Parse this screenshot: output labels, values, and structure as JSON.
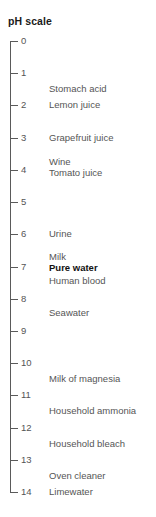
{
  "figure": {
    "title": "pH scale",
    "axis_color": "#5a5a5a",
    "text_color": "#555555",
    "highlight_color": "#111111"
  },
  "chart_data": {
    "type": "scatter",
    "title": "pH scale",
    "xlabel": "",
    "ylabel": "pH",
    "ylim": [
      0,
      14
    ],
    "grid": false,
    "legend": null,
    "axis_orientation": "vertical",
    "tick_labels": [
      "0",
      "1",
      "2",
      "3",
      "4",
      "5",
      "6",
      "7",
      "8",
      "9",
      "10",
      "11",
      "12",
      "13",
      "14"
    ],
    "ticks": [
      0,
      1,
      2,
      3,
      4,
      5,
      6,
      7,
      8,
      9,
      10,
      11,
      12,
      13,
      14
    ],
    "annotations": [
      {
        "label": "Stomach acid",
        "ph": 1.5,
        "emphasis": false
      },
      {
        "label": "Lemon juice",
        "ph": 2.0,
        "emphasis": false
      },
      {
        "label": "Grapefruit juice",
        "ph": 3.0,
        "emphasis": false
      },
      {
        "label": "Wine",
        "ph": 3.75,
        "emphasis": false
      },
      {
        "label": "Tomato juice",
        "ph": 4.1,
        "emphasis": false
      },
      {
        "label": "Urine",
        "ph": 6.0,
        "emphasis": false
      },
      {
        "label": "Milk",
        "ph": 6.72,
        "emphasis": false
      },
      {
        "label": "Pure water",
        "ph": 7.05,
        "emphasis": true
      },
      {
        "label": "Human blood",
        "ph": 7.45,
        "emphasis": false
      },
      {
        "label": "Seawater",
        "ph": 8.45,
        "emphasis": false
      },
      {
        "label": "Milk of magnesia",
        "ph": 10.5,
        "emphasis": false
      },
      {
        "label": "Household ammonia",
        "ph": 11.5,
        "emphasis": false
      },
      {
        "label": "Household bleach",
        "ph": 12.5,
        "emphasis": false
      },
      {
        "label": "Oven cleaner",
        "ph": 13.5,
        "emphasis": false
      },
      {
        "label": "Limewater",
        "ph": 14.0,
        "emphasis": false
      }
    ]
  }
}
